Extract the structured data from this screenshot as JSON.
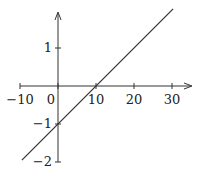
{
  "chart_data": {
    "type": "line",
    "title": "",
    "xlabel": "",
    "ylabel": "",
    "xlim": [
      -10,
      35
    ],
    "ylim": [
      -2,
      2
    ],
    "grid": false,
    "legend": null,
    "x_ticks": [
      -10,
      0,
      10,
      20,
      30
    ],
    "x_tick_labels": [
      "−10",
      "0",
      "10",
      "20",
      "30"
    ],
    "y_ticks": [
      1,
      -1,
      -2
    ],
    "y_tick_labels": [
      "1",
      "−1",
      "−2"
    ],
    "series": [
      {
        "name": "y = 0.1x - 1",
        "x": [
          -10,
          0,
          10,
          20,
          30
        ],
        "y": [
          -2,
          -1,
          0,
          1,
          2
        ]
      }
    ],
    "annotations": [
      {
        "x": 0,
        "y": -1,
        "note": "y-intercept"
      },
      {
        "x": 10,
        "y": 0,
        "note": "x-intercept"
      }
    ]
  },
  "colors": {
    "axis": "#333333",
    "line": "#333333",
    "background": "#ffffff"
  }
}
